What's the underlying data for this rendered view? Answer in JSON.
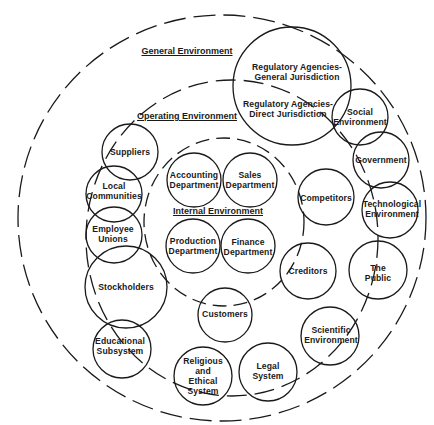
{
  "diagram": {
    "type": "nested-environment-diagram",
    "stroke_color": "#1a1a1a",
    "background": "#ffffff",
    "environments": [
      {
        "id": "general",
        "label": "General Environment"
      },
      {
        "id": "operating",
        "label": "Operating Environment"
      },
      {
        "id": "internal",
        "label": "Internal Environment"
      }
    ],
    "nodes": {
      "regulatory_general": {
        "lines": [
          "Regulatory Agencies-",
          "General Jurisdiction"
        ]
      },
      "regulatory_direct": {
        "lines": [
          "Regulatory Agencies-",
          "Direct Jurisdiction"
        ]
      },
      "social": {
        "lines": [
          "Social",
          "Environment"
        ]
      },
      "government": {
        "lines": [
          "Government"
        ]
      },
      "technological": {
        "lines": [
          "Technological",
          "Environment"
        ]
      },
      "competitors": {
        "lines": [
          "Competitors"
        ]
      },
      "the_public": {
        "lines": [
          "The",
          "Public"
        ]
      },
      "creditors": {
        "lines": [
          "Creditors"
        ]
      },
      "scientific": {
        "lines": [
          "Scientific",
          "Environment"
        ]
      },
      "legal": {
        "lines": [
          "Legal",
          "System"
        ]
      },
      "religious": {
        "lines": [
          "Religious",
          "and",
          "Ethical",
          "System"
        ]
      },
      "customers": {
        "lines": [
          "Customers"
        ]
      },
      "educational": {
        "lines": [
          "Educational",
          "Subsystem"
        ]
      },
      "stockholders": {
        "lines": [
          "Stockholders"
        ]
      },
      "employee_unions": {
        "lines": [
          "Employee",
          "Unions"
        ]
      },
      "local_communities": {
        "lines": [
          "Local",
          "Communities"
        ]
      },
      "suppliers": {
        "lines": [
          "Suppliers"
        ]
      },
      "accounting": {
        "lines": [
          "Accounting",
          "Department"
        ]
      },
      "sales": {
        "lines": [
          "Sales",
          "Department"
        ]
      },
      "production": {
        "lines": [
          "Production",
          "Department"
        ]
      },
      "finance": {
        "lines": [
          "Finance",
          "Department"
        ]
      }
    }
  }
}
